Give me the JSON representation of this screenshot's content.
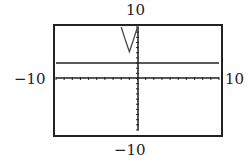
{
  "chart_data": {
    "type": "line",
    "title": "",
    "xlabel": "",
    "ylabel": "",
    "xlim": [
      -10,
      10
    ],
    "ylim": [
      -10,
      10
    ],
    "window_labels": {
      "ymax": "10",
      "ymin": "-10",
      "xmin": "-10",
      "xmax": "10"
    },
    "grid": false,
    "tick_marks": "1 unit",
    "series": [
      {
        "name": "horizontal line",
        "equation": "y = 3",
        "points": [
          [
            -10,
            3
          ],
          [
            10,
            3
          ]
        ]
      },
      {
        "name": "parabola",
        "description": "upward parabola, vertex near (-1, 5)",
        "points": [
          [
            -2,
            10
          ],
          [
            -1.5,
            7.5
          ],
          [
            -1,
            5.2
          ],
          [
            -0.5,
            7.5
          ],
          [
            0,
            10
          ]
        ]
      }
    ]
  },
  "labels": {
    "top": "10",
    "bottom": "−10",
    "left": "−10",
    "right": "10"
  }
}
